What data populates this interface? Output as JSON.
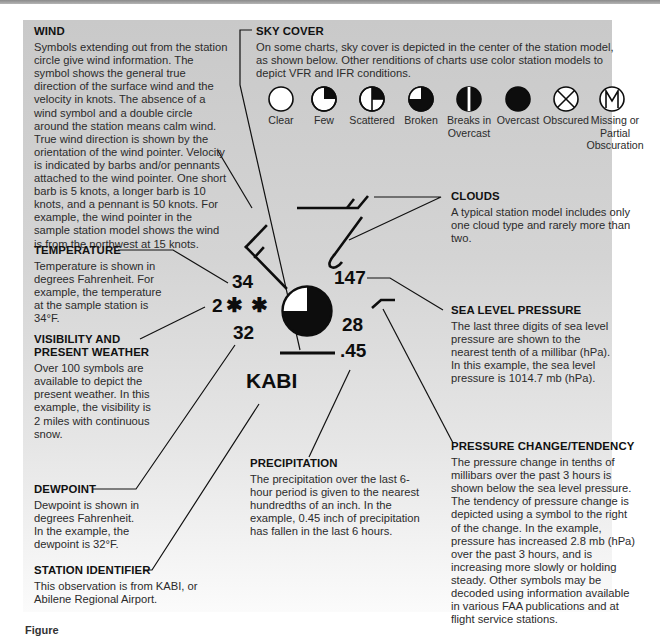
{
  "wind": {
    "heading": "WIND",
    "body": "Symbols extending out from the station circle give wind information. The symbol shows the general true direction of the surface wind and the velocity in knots. The absence of a wind symbol and a double circle around the station means calm wind. True wind direction is shown by the orientation of the wind pointer. Velocity is indicated by barbs and/or pennants attached to the wind pointer. One short barb is 5 knots, a longer barb is 10 knots, and a pennant is 50 knots. For example, the wind pointer in the sample station model shows the wind is from the northwest at 15 knots."
  },
  "sky_cover": {
    "heading": "SKY COVER",
    "body": "On some charts, sky cover is depicted in the center of the station model, as shown below. Other renditions of charts use color station models to depict VFR and IFR conditions.",
    "symbols": [
      {
        "label": "Clear",
        "icon": "sky-clear-icon"
      },
      {
        "label": "Few",
        "icon": "sky-few-icon"
      },
      {
        "label": "Scattered",
        "icon": "sky-scattered-icon"
      },
      {
        "label": "Broken",
        "icon": "sky-broken-icon"
      },
      {
        "label": "Breaks in Overcast",
        "icon": "sky-breaks-in-overcast-icon"
      },
      {
        "label": "Overcast",
        "icon": "sky-overcast-icon"
      },
      {
        "label": "Obscured",
        "icon": "sky-obscured-icon"
      },
      {
        "label": "Missing or Partial Obscuration",
        "icon": "sky-missing-partial-obscuration-icon"
      }
    ]
  },
  "clouds": {
    "heading": "CLOUDS",
    "body": "A typical station model includes only one cloud type and rarely more than two."
  },
  "temperature": {
    "heading": "TEMPERATURE",
    "body": "Temperature is shown in degrees Fahrenheit. For example, the temperature at the sample station is 34°F."
  },
  "visibility": {
    "heading": "VISIBILITY AND PRESENT WEATHER",
    "body": "Over 100 symbols are available to depict the present weather. In this example, the visibility is 2 miles with continuous snow."
  },
  "sea_level_pressure": {
    "heading": "SEA LEVEL PRESSURE",
    "body": "The last three digits of sea level pressure are shown to the nearest tenth of a millibar (hPa). In this example, the sea level pressure is 1014.7 mb (hPa)."
  },
  "pressure_change": {
    "heading": "PRESSURE CHANGE/TENDENCY",
    "body": "The pressure change in tenths of millibars over the past 3 hours is shown below the sea level pressure. The tendency of pressure change is depicted using a symbol to the right of the change. In the example, pressure has increased 2.8 mb (hPa) over the past 3 hours, and is increasing more slowly or holding steady. Other symbols may be decoded using information available in various FAA publications and at flight service stations."
  },
  "precipitation": {
    "heading": "PRECIPITATION",
    "body": "The precipitation over the last 6-hour period is given to the nearest hundredths of an inch. In the example, 0.45 inch of precipitation has fallen in the last 6 hours."
  },
  "dewpoint": {
    "heading": "DEWPOINT",
    "body": "Dewpoint is shown in degrees Fahrenheit. In the example, the dewpoint is 32°F."
  },
  "station_identifier": {
    "heading": "STATION IDENTIFIER",
    "body": "This observation is from KABI, or Abilene Regional Airport."
  },
  "station_model": {
    "temperature": "34",
    "visibility": "2",
    "present_weather_symbol": "✱ ✱",
    "dewpoint": "32",
    "sea_level_pressure": "147",
    "pressure_change": "28",
    "precipitation": ".45",
    "station_id": "KABI",
    "sky_cover": "broken"
  },
  "caption": {
    "text": "Figure"
  }
}
